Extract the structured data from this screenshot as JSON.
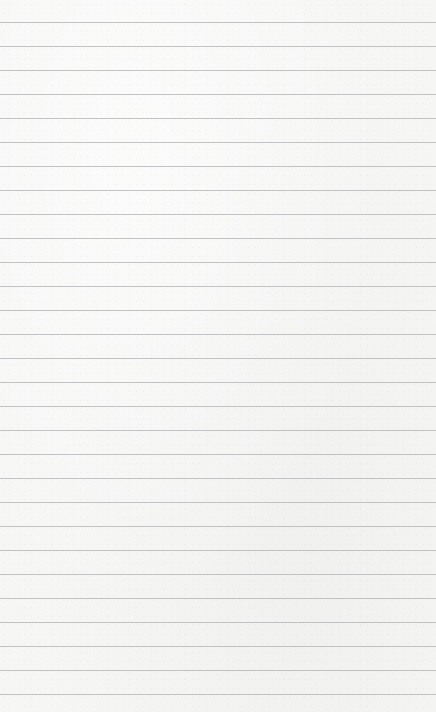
{
  "page": {
    "type": "blank lined paper",
    "background_color": "#f6f6f5",
    "line_color": "#b9b9b8",
    "first_line_y": 22,
    "line_spacing": 24,
    "line_count": 29
  }
}
